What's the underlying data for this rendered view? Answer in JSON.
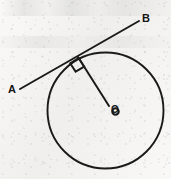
{
  "figure": {
    "background_color": "#f3f2f0",
    "ink_color": "#1a1a1a",
    "labels": {
      "point_a": "A",
      "point_b": "B",
      "centre_o": "O"
    },
    "geometry": {
      "circle": {
        "cx": 105.5,
        "cy": 110.5,
        "r": 58.0
      },
      "tangent_line": {
        "x1": 20,
        "y1": 89,
        "x2": 139,
        "y2": 21
      },
      "tangent_point": {
        "x": 78,
        "y": 57
      },
      "radius_segment": {
        "x1": 78,
        "y1": 57,
        "x2": 109,
        "y2": 106
      },
      "right_angle_marker": {
        "points": "70.5,62.5 78.5,57.5 84,66 76,71",
        "angle_degrees": 90
      },
      "centre_dot": {
        "cx": 115.5,
        "cy": 111.5,
        "r": 3.2
      }
    }
  }
}
